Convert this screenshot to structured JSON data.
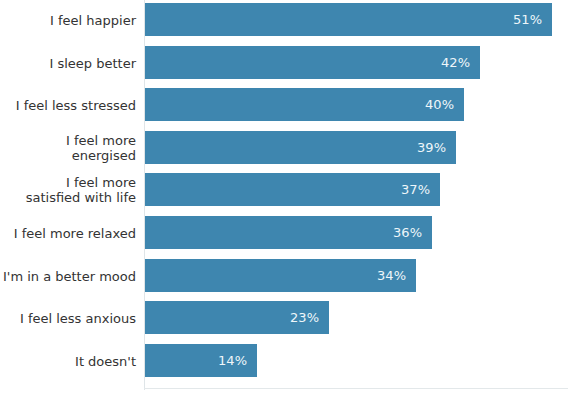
{
  "chart_data": {
    "type": "bar",
    "orientation": "horizontal",
    "title": "",
    "xlabel": "",
    "ylabel": "",
    "grid": false,
    "legend": false,
    "xlim": [
      0,
      52
    ],
    "value_suffix": "%",
    "bar_color": "#3e86af",
    "label_color": "#333333",
    "value_label_color": "#eef6fa",
    "background": "#ffffff",
    "categories": [
      "I feel happier",
      "I sleep better",
      "I feel less stressed",
      "I feel more energised",
      "I feel more\nsatisfied with life",
      "I feel more relaxed",
      "I'm in a better mood",
      "I feel less anxious",
      "It doesn't"
    ],
    "values": [
      51,
      42,
      40,
      39,
      37,
      36,
      34,
      23,
      14
    ],
    "value_labels": [
      "51%",
      "42%",
      "40%",
      "39%",
      "37%",
      "36%",
      "34%",
      "23%",
      "14%"
    ]
  }
}
